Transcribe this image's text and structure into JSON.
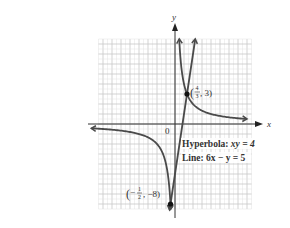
{
  "chart_data": {
    "type": "line",
    "title": "",
    "xlabel": "x",
    "ylabel": "y",
    "origin_label": "0",
    "xlim": [
      -8.5,
      8.5
    ],
    "ylim": [
      -8.5,
      8.5
    ],
    "grid": true,
    "series": [
      {
        "name": "Hyperbola: xy = 4",
        "equation": "xy = 4",
        "branches": [
          {
            "x_from": 0.47,
            "x_to": 8.0
          },
          {
            "x_from": -9.3,
            "x_to": -0.47
          }
        ]
      },
      {
        "name": "Line: 6x − y = 5",
        "equation": "6x - y = 5",
        "x_from": -0.6,
        "x_to": 2.25
      }
    ],
    "intersections": [
      {
        "x": 1.3333,
        "y": 3,
        "label_x_num": "4",
        "label_x_den": "3",
        "label_y": "3"
      },
      {
        "x": -0.5,
        "y": -8,
        "label_x_num": "1",
        "label_x_den": "2",
        "label_y": "−8",
        "negative_x": true
      }
    ],
    "annotations": [
      {
        "text": "Hyperbola: xy = 4"
      },
      {
        "text": "Line: 6x − y = 5"
      }
    ],
    "colors": {
      "curve": "#4a4a4a",
      "axis": "#333333",
      "grid_major": "#c8c8c8",
      "grid_minor": "#e2e2e2",
      "point": "#111111"
    }
  },
  "labels": {
    "x_axis": "x",
    "y_axis": "y",
    "origin": "0",
    "hyperbola_prefix": "Hyperbola: ",
    "hyperbola_eq": "xy = 4",
    "line_prefix": "Line: ",
    "line_eq": "6x − y = 5",
    "point1_num": "4",
    "point1_den": "3",
    "point1_y": ", 3)",
    "point2_num": "1",
    "point2_den": "2",
    "point2_y": ", −8)"
  }
}
